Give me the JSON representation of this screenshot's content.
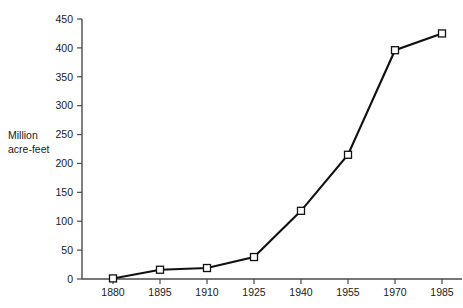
{
  "chart_data": {
    "type": "line",
    "title": "",
    "subtitle": "",
    "xlabel": "",
    "ylabel": "Million acre-feet",
    "ylabel_line1": "Million",
    "ylabel_line2": "acre-feet",
    "categories": [
      1880,
      1895,
      1910,
      1925,
      1940,
      1955,
      1970,
      1985
    ],
    "x": [
      1880,
      1895,
      1910,
      1925,
      1940,
      1955,
      1970,
      1985
    ],
    "values": [
      1,
      16,
      19,
      38,
      118,
      215,
      396,
      425
    ],
    "series": [
      {
        "name": "Water use",
        "values": [
          1,
          16,
          19,
          38,
          118,
          215,
          396,
          425
        ]
      }
    ],
    "xlim": [
      1880,
      1992
    ],
    "ylim": [
      0,
      450
    ],
    "ytick_values": [
      0,
      50,
      100,
      150,
      200,
      250,
      300,
      350,
      400,
      450
    ],
    "ytick_labels": [
      "0",
      "50",
      "100",
      "150",
      "200",
      "250",
      "300",
      "350",
      "400",
      "450"
    ],
    "xtick_values": [
      1880,
      1895,
      1910,
      1925,
      1940,
      1955,
      1970,
      1985
    ],
    "xtick_labels": [
      "1880",
      "1895",
      "1910",
      "1925",
      "1940",
      "1955",
      "1970",
      "1985"
    ],
    "grid": false,
    "legend": false,
    "legend_position": "none",
    "marker": "open-square",
    "line_color": "#111111",
    "marker_fill_color": "#ffffff",
    "marker_edge_color": "#111111",
    "axis_color": "#4a4a4a",
    "background_color": "#ffffff"
  }
}
